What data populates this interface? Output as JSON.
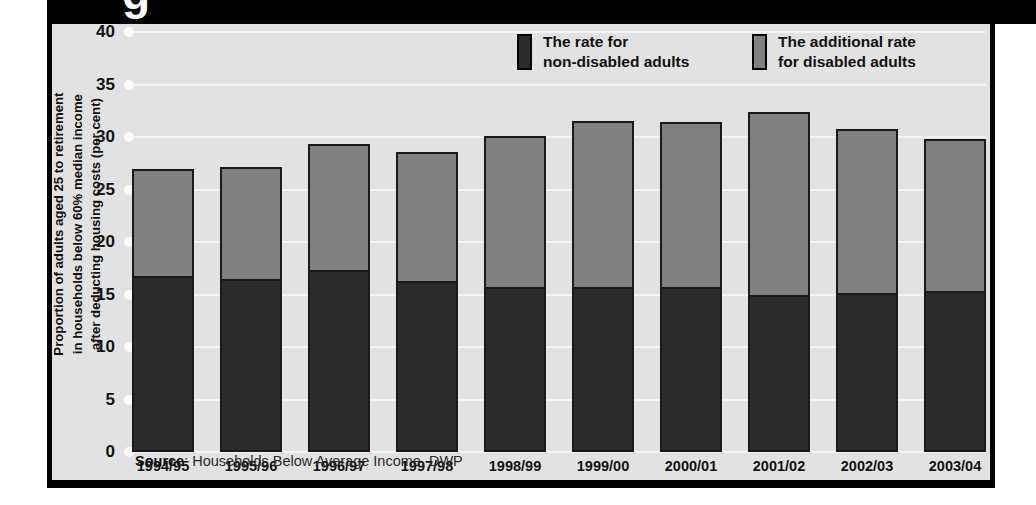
{
  "header": {
    "title_fragment": "g"
  },
  "legend": {
    "items": [
      {
        "label": "The rate for\nnon-disabled adults",
        "color": "#2b2b2b",
        "swatch": "legend-swatch-dark"
      },
      {
        "label": "The additional rate\nfor disabled adults",
        "color": "#808080",
        "swatch": "legend-swatch-light"
      }
    ]
  },
  "source": {
    "prefix": "Source",
    "text": ": Households Below Average Income, DWP"
  },
  "chart_data": {
    "type": "bar",
    "stacked": true,
    "title": "",
    "xlabel": "",
    "ylabel": "Proportion of adults aged 25 to retirement\nin households below 60% median income\nafter deducting housing costs (per cent)",
    "ylim": [
      0,
      40
    ],
    "yticks": [
      0,
      5,
      10,
      15,
      20,
      25,
      30,
      35,
      40
    ],
    "ytick_labels": [
      "0",
      "5",
      "10",
      "15",
      "20",
      "25",
      "30",
      "35",
      "40"
    ],
    "grid": true,
    "grid_color": "#f4f4f4",
    "legend_position": "top-right",
    "categories": [
      "1994/95",
      "1995/96",
      "1996/97",
      "1997/98",
      "1998/99",
      "1999/00",
      "2000/01",
      "2001/02",
      "2002/03",
      "2003/04"
    ],
    "series": [
      {
        "name": "The rate for non-disabled adults",
        "color": "#2b2b2b",
        "values": [
          17.0,
          16.7,
          17.5,
          16.5,
          15.9,
          15.9,
          15.9,
          15.1,
          15.3,
          15.5
        ]
      },
      {
        "name": "The additional rate for disabled adults",
        "color": "#808080",
        "values": [
          10.0,
          10.4,
          11.8,
          12.1,
          14.2,
          15.6,
          15.5,
          17.3,
          15.5,
          14.3
        ]
      }
    ],
    "totals": [
      27.0,
      27.1,
      29.3,
      28.6,
      30.1,
      31.5,
      31.4,
      32.4,
      30.8,
      29.8
    ],
    "background": "#e2e2e2",
    "frame_color": "#000000"
  }
}
